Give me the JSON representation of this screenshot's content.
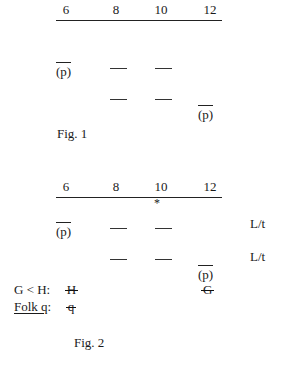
{
  "figures": [
    {
      "id": "figure-1",
      "caption": "Fig. 1",
      "scale": {
        "ticks": [
          "6",
          "8",
          "10",
          "12"
        ],
        "asterisk": ""
      },
      "marks_upper": {
        "left_token": "(p)",
        "dashes": 2
      },
      "marks_lower": {
        "right_token": "(p)",
        "dashes": 2
      },
      "side_labels": []
    },
    {
      "id": "figure-2",
      "caption": "Fig. 2",
      "scale": {
        "ticks": [
          "6",
          "8",
          "10",
          "12"
        ],
        "asterisk": "*"
      },
      "marks_upper": {
        "left_token": "(p)",
        "dashes": 2
      },
      "marks_lower": {
        "right_token": "(p)",
        "dashes": 2
      },
      "side_labels": [
        "L/t",
        "L/t"
      ],
      "annotations": [
        {
          "label_plain": "G < H:",
          "label_underlined": "",
          "label_tail": "",
          "value": "H"
        },
        {
          "label_plain": "",
          "label_underlined": "Folk q",
          "label_tail": ":",
          "value": "q"
        }
      ],
      "extra_struck_symbol": "G"
    }
  ]
}
